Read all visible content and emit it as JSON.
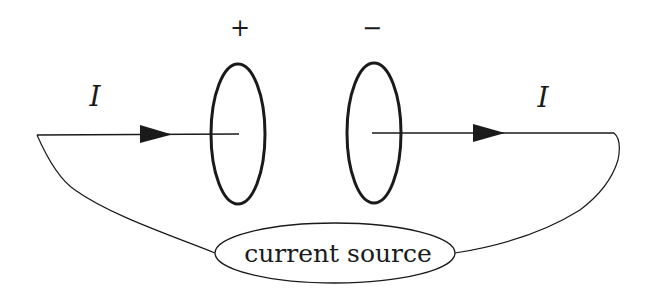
{
  "diagram": {
    "plus_label": "+",
    "minus_label": "−",
    "current_left_label": "I",
    "current_right_label": "I",
    "source_label": "current source"
  },
  "colors": {
    "stroke": "#1a1a1a",
    "background": "#ffffff"
  }
}
